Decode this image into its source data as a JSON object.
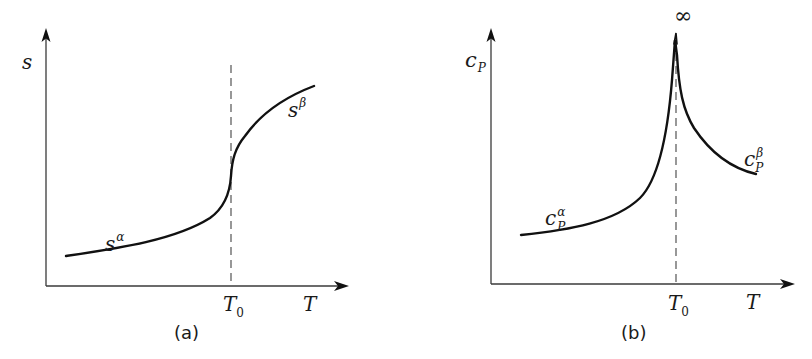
{
  "figure": {
    "panels": [
      {
        "id": "a",
        "caption": "(a)",
        "y_label": "s",
        "x_label": "T",
        "transition_tick": "T",
        "transition_tick_sub": "0",
        "low_phase_label": "s",
        "low_phase_sup": "α",
        "high_phase_label": "s",
        "high_phase_sup": "β"
      },
      {
        "id": "b",
        "caption": "(b)",
        "y_label": "c",
        "y_label_sub": "P",
        "x_label": "T",
        "transition_tick": "T",
        "transition_tick_sub": "0",
        "peak_label": "∞",
        "low_phase_label": "c",
        "low_phase_sub": "P",
        "low_phase_sup": "α",
        "high_phase_label": "c",
        "high_phase_sub": "P",
        "high_phase_sup": "β"
      }
    ]
  },
  "colors": {
    "curve": "#111111",
    "axis": "#3a3a3a",
    "background": "#ffffff"
  }
}
